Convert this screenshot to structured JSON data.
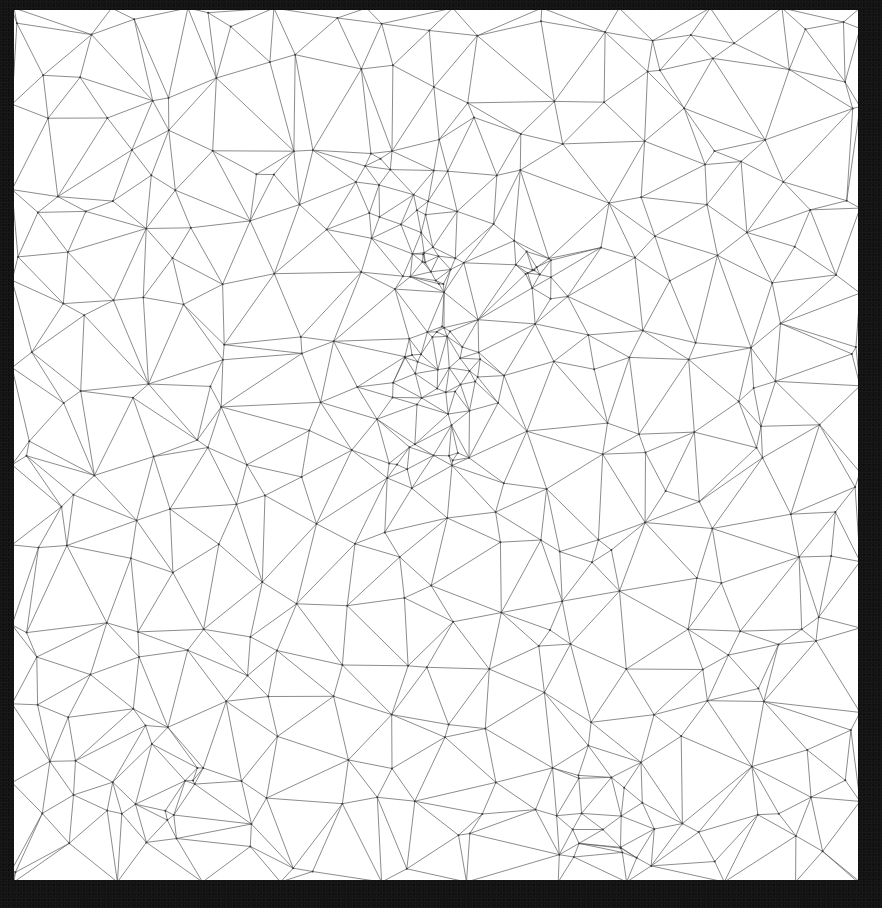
{
  "artwork": {
    "subject": "low-poly triangulated line drawing of an animal face",
    "panel": {
      "x": 14,
      "y": 10,
      "width": 844,
      "height": 870
    },
    "colors": {
      "frame": "#141414",
      "panel": "#ffffff",
      "stroke": "#5a5a5a",
      "vertex": "#3a3a3a"
    },
    "seed": 7,
    "background_points": 330,
    "clusters": [
      {
        "name": "left-eye",
        "cx": 430,
        "cy": 270,
        "r": 28,
        "n": 14
      },
      {
        "name": "right-eye",
        "cx": 535,
        "cy": 270,
        "r": 22,
        "n": 12
      },
      {
        "name": "nose",
        "cx": 445,
        "cy": 370,
        "r": 45,
        "n": 26
      },
      {
        "name": "mouth-line",
        "cx": 420,
        "cy": 440,
        "r": 60,
        "n": 14
      },
      {
        "name": "brow",
        "cx": 400,
        "cy": 200,
        "r": 60,
        "n": 14
      },
      {
        "name": "bottom-right",
        "cx": 600,
        "cy": 820,
        "r": 55,
        "n": 14
      },
      {
        "name": "bottom-left",
        "cx": 150,
        "cy": 780,
        "r": 60,
        "n": 10
      }
    ]
  }
}
